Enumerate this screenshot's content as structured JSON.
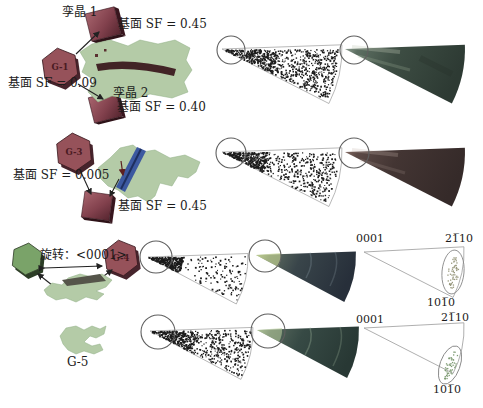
{
  "figure": {
    "annotations": {
      "g1": {
        "grain": "G-1",
        "twin1": "孪晶 1",
        "twin1_sf": "基面 SF = 0.45",
        "basal_sf": "基面 SF = 0.09",
        "twin2": "孪晶 2",
        "twin2_sf": "基面 SF = 0.40"
      },
      "g3": {
        "grain": "G-3",
        "basal_sf": "基面 SF = 0.005",
        "twin_sf": "基面 SF = 0.45"
      },
      "g4": {
        "grain": "G-4",
        "rotation": "旋转：<0001>"
      },
      "g5": {
        "grain": "G-5"
      },
      "ipf_g4": {
        "c_axis": "0001",
        "a_axis": "21̅10",
        "m_axis": "101̅0"
      },
      "ipf_g5": {
        "c_axis": "0001",
        "a_axis": "21̅10",
        "m_axis": "101̅0"
      }
    },
    "colors": {
      "dot": "#1c1c1c",
      "ring": "#5f5f5f",
      "wedge_outline": "#9a9a9a",
      "hex_red": "#96525a",
      "hex_red_dark": "#46242c",
      "hex_green": "#7aa369",
      "hex_green_dark": "#2c3d26",
      "grain_green": "#b4cba7",
      "grain_edge": "#8fae85",
      "band_red": "#422426",
      "band_blue": "#3c59a0",
      "band_olive": "#55554a",
      "label_red": "#4a1a22",
      "arrow": "#222222",
      "w1": [
        "#97a698",
        "#5d6f62",
        "#3d4d43",
        "#2d3a33"
      ],
      "w2": [
        "#8a7068",
        "#5c4a46",
        "#433533",
        "#352a29"
      ],
      "w3": [
        "#b4c690",
        "#5e6c60",
        "#39454a",
        "#272f3a"
      ],
      "w4": [
        "#a8bb97",
        "#57695c",
        "#374a45",
        "#283834"
      ]
    },
    "pole_figures": {
      "scatter": [
        {
          "seed": 11,
          "apex": [
            222,
            49
          ],
          "r": 118,
          "a1": -1,
          "a2": 27,
          "n": 620,
          "cluster_n": 210,
          "cluster_r": 55
        },
        {
          "seed": 22,
          "apex": [
            222,
            152
          ],
          "r": 118,
          "a1": -1,
          "a2": 27,
          "n": 430,
          "cluster_n": 280,
          "cluster_r": 45
        },
        {
          "seed": 33,
          "apex": [
            148,
            257
          ],
          "r": 100,
          "a1": -2,
          "a2": 28,
          "n": 140,
          "cluster_n": 300,
          "cluster_r": 34
        },
        {
          "seed": 44,
          "apex": [
            150,
            331
          ],
          "r": 103,
          "a1": -2,
          "a2": 28,
          "n": 400,
          "cluster_n": 260,
          "cluster_r": 45
        }
      ],
      "ellipse_clusters": [
        {
          "seed": 5,
          "cx": 453,
          "cy": 272,
          "rx": 7,
          "ry": 16,
          "rot": 5,
          "n": 55,
          "color": "#99997f"
        },
        {
          "seed": 6,
          "cx": 450,
          "cy": 365,
          "rx": 6,
          "ry": 15,
          "rot": 20,
          "n": 48,
          "color": "#7f9c74"
        }
      ]
    }
  }
}
